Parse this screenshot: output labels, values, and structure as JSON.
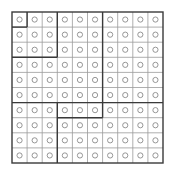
{
  "puzzle": {
    "rows": 10,
    "cols": 10,
    "origin": {
      "x": 12,
      "y": 12
    },
    "cell_size": 15.1,
    "cell_symbol": "hollow-circle",
    "colors": {
      "background": "#ffffff",
      "thin_grid": "#9a9a9a",
      "thick_grid": "#3a3a3a",
      "circle": "#8a8a8a"
    },
    "thick_vertical_segments": [
      {
        "col_line": 1,
        "row_start": 0,
        "row_end": 1
      },
      {
        "col_line": 3,
        "row_start": 0,
        "row_end": 3
      },
      {
        "col_line": 3,
        "row_start": 6,
        "row_end": 10
      },
      {
        "col_line": 6,
        "row_start": 0,
        "row_end": 6
      },
      {
        "col_line": 6,
        "row_start": 6,
        "row_end": 7
      }
    ],
    "thick_horizontal_segments": [
      {
        "row_line": 1,
        "col_start": 0,
        "col_end": 1
      },
      {
        "row_line": 3,
        "col_start": 0,
        "col_end": 3
      },
      {
        "row_line": 6,
        "col_start": 0,
        "col_end": 10
      },
      {
        "row_line": 7,
        "col_start": 3,
        "col_end": 6
      }
    ],
    "cells": [
      [
        "o",
        "o",
        "o",
        "o",
        "o",
        "o",
        "o",
        "o",
        "o",
        "o"
      ],
      [
        "o",
        "o",
        "o",
        "o",
        "o",
        "o",
        "o",
        "o",
        "o",
        "o"
      ],
      [
        "o",
        "o",
        "o",
        "o",
        "o",
        "o",
        "o",
        "o",
        "o",
        "o"
      ],
      [
        "o",
        "o",
        "o",
        "o",
        "o",
        "o",
        "o",
        "o",
        "o",
        "o"
      ],
      [
        "o",
        "o",
        "o",
        "o",
        "o",
        "o",
        "o",
        "o",
        "o",
        "o"
      ],
      [
        "o",
        "o",
        "o",
        "o",
        "o",
        "o",
        "o",
        "o",
        "o",
        "o"
      ],
      [
        "o",
        "o",
        "o",
        "o",
        "o",
        "o",
        "o",
        "o",
        "o",
        "o"
      ],
      [
        "o",
        "o",
        "o",
        "o",
        "o",
        "o",
        "o",
        "o",
        "o",
        "o"
      ],
      [
        "o",
        "o",
        "o",
        "o",
        "o",
        "o",
        "o",
        "o",
        "o",
        "o"
      ],
      [
        "o",
        "o",
        "o",
        "o",
        "o",
        "o",
        "o",
        "o",
        "o",
        "o"
      ]
    ]
  }
}
